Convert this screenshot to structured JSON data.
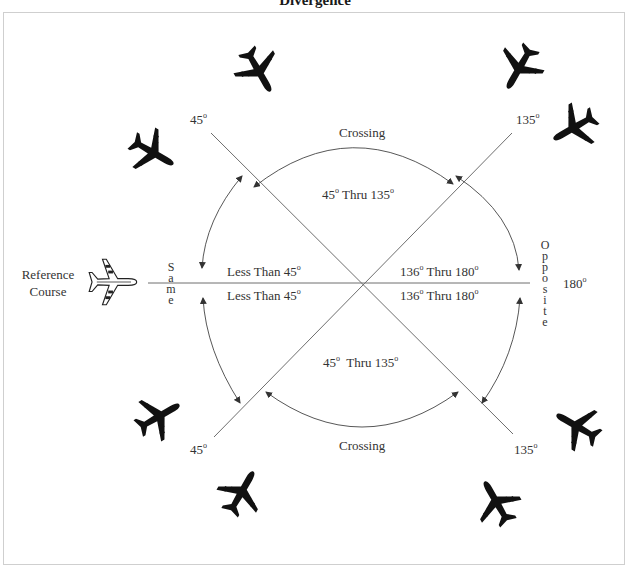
{
  "title": "Divergence",
  "reference": {
    "line1": "Reference",
    "line2": "Course"
  },
  "zones": {
    "same": {
      "label": "Same",
      "letters": [
        "S",
        "a",
        "m",
        "e"
      ]
    },
    "opposite": {
      "label": "Opposite",
      "letters": [
        "O",
        "p",
        "p",
        "o",
        "s",
        "i",
        "t",
        "e"
      ]
    },
    "crossing_top": "Crossing",
    "crossing_bottom": "Crossing"
  },
  "ranges": {
    "less_than_top": "Less Than 45",
    "less_than_bottom": "Less Than 45",
    "crossing_top": "45",
    "crossing_top_thru": " Thru 135",
    "crossing_bottom": "45",
    "crossing_bottom_thru": "  Thru 135",
    "opposite_top": "136",
    "opposite_top_thru": " Thru 180",
    "opposite_bottom": "136",
    "opposite_bottom_thru": " Thru 180"
  },
  "angles": {
    "upper_left": "45",
    "lower_left": "45",
    "upper_right": "135",
    "lower_right": "135",
    "right": "180"
  },
  "degree_symbol": "o",
  "colors": {
    "line": "#6e6e6e",
    "plane": "#111111",
    "frame": "#cfcfcf"
  },
  "icons": [
    "reference-airplane-icon",
    "airplane-silhouette-icon"
  ]
}
